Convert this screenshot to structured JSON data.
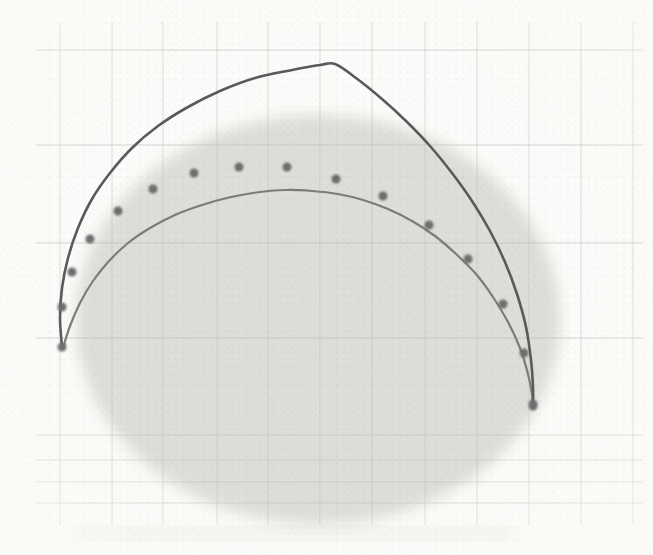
{
  "figure": {
    "kind": "scanned-plot",
    "width": 653,
    "height": 555,
    "background_color": "#fbfbf9",
    "caption_bleed": "",
    "alt": "Scanned graph-paper plot with two arch-shaped curves and a row of round data points, over a faint gray circular blob"
  },
  "chart_data": {
    "type": "line",
    "title": "",
    "subtitle": "",
    "xlabel": "",
    "ylabel": "",
    "xlim": [
      0,
      653
    ],
    "ylim": [
      555,
      0
    ],
    "grid": true,
    "grid_color": "#b9bcb8",
    "legend_position": "none",
    "axis_tick_labels_x": [],
    "axis_tick_labels_y": [],
    "grid_vertical_x": [
      60,
      112,
      163,
      217,
      268,
      320,
      372,
      425,
      477,
      529,
      581,
      633
    ],
    "grid_horizontal_y": [
      50,
      145,
      243,
      338,
      435,
      460,
      482,
      503
    ],
    "grid_horizontal_major_y": [
      50,
      145,
      243,
      338
    ],
    "series": [
      {
        "name": "upper-curve",
        "style": "solid",
        "color": "#5a5a5a",
        "width": 2.6,
        "peak": {
          "x": 335,
          "y": 64
        },
        "points": [
          [
            62,
            347
          ],
          [
            60,
            318
          ],
          [
            62,
            288
          ],
          [
            68,
            258
          ],
          [
            78,
            228
          ],
          [
            92,
            199
          ],
          [
            110,
            173
          ],
          [
            132,
            148
          ],
          [
            158,
            126
          ],
          [
            188,
            107
          ],
          [
            220,
            91
          ],
          [
            255,
            78
          ],
          [
            292,
            70
          ],
          [
            320,
            65
          ],
          [
            335,
            64
          ],
          [
            356,
            78
          ],
          [
            382,
            99
          ],
          [
            406,
            121
          ],
          [
            430,
            146
          ],
          [
            452,
            173
          ],
          [
            472,
            201
          ],
          [
            490,
            231
          ],
          [
            505,
            262
          ],
          [
            517,
            294
          ],
          [
            526,
            327
          ],
          [
            531,
            360
          ],
          [
            533,
            388
          ],
          [
            533,
            406
          ]
        ]
      },
      {
        "name": "lower-curve",
        "style": "solid",
        "color": "#7b7b7b",
        "width": 2.2,
        "peak": {
          "x": 286,
          "y": 190
        },
        "points": [
          [
            63,
            348
          ],
          [
            70,
            326
          ],
          [
            80,
            303
          ],
          [
            93,
            281
          ],
          [
            109,
            261
          ],
          [
            128,
            243
          ],
          [
            150,
            228
          ],
          [
            175,
            215
          ],
          [
            202,
            205
          ],
          [
            231,
            197
          ],
          [
            260,
            192
          ],
          [
            286,
            190
          ],
          [
            312,
            191
          ],
          [
            338,
            194
          ],
          [
            363,
            200
          ],
          [
            388,
            209
          ],
          [
            412,
            221
          ],
          [
            435,
            236
          ],
          [
            456,
            254
          ],
          [
            476,
            274
          ],
          [
            493,
            297
          ],
          [
            508,
            322
          ],
          [
            520,
            348
          ],
          [
            528,
            374
          ],
          [
            532,
            394
          ],
          [
            533,
            406
          ]
        ]
      }
    ],
    "scatter": {
      "name": "data-points",
      "color": "#6e6e6e",
      "marker": "circle",
      "marker_size": 9,
      "count": 17,
      "points": [
        [
          62,
          307
        ],
        [
          72,
          272
        ],
        [
          90,
          239
        ],
        [
          118,
          211
        ],
        [
          153,
          189
        ],
        [
          194,
          173
        ],
        [
          239,
          167
        ],
        [
          287,
          167
        ],
        [
          336,
          179
        ],
        [
          383,
          196
        ],
        [
          429,
          225
        ],
        [
          468,
          259
        ],
        [
          503,
          304
        ],
        [
          524,
          353
        ],
        [
          533,
          404
        ],
        [
          62,
          347
        ],
        [
          533,
          406
        ]
      ]
    },
    "shaded_region": {
      "name": "gray-blob",
      "shape": "ellipse",
      "cx": 318,
      "cy": 320,
      "rx": 242,
      "ry": 205,
      "color": "#d7d7d4",
      "opacity": 0.85
    }
  }
}
